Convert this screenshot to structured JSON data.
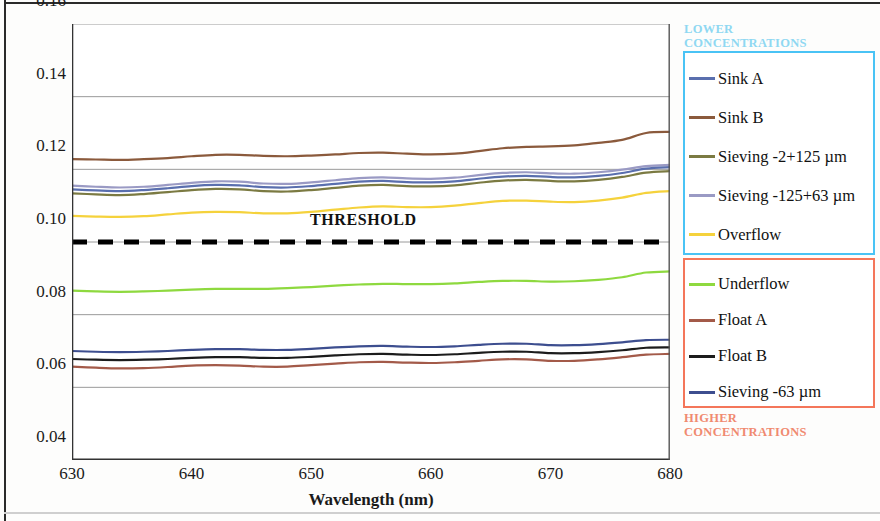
{
  "axes": {
    "ylabel": "Reflectance (%)",
    "xlabel": "Wavelength (nm)",
    "yticks": [
      "0.16",
      "0.14",
      "0.12",
      "0.10",
      "0.08",
      "0.06",
      "0.04"
    ],
    "xticks": [
      "630",
      "640",
      "650",
      "660",
      "670",
      "680"
    ]
  },
  "annotations": {
    "threshold": "THRESHOLD"
  },
  "legend": {
    "lower": {
      "title": "LOWER\nCONCENTRATIONS",
      "title_line1": "LOWER",
      "title_line2": "CONCENTRATIONS",
      "border_color": "#49c3f5",
      "title_color": "#8fd8f2",
      "items": [
        {
          "label": "Sink A",
          "color": "#5a6fae"
        },
        {
          "label": "Sink  B",
          "color": "#8b5a3c"
        },
        {
          "label": "Sieving  -2+125 µm",
          "color": "#7b7a42"
        },
        {
          "label": "Sieving -125+63 µm",
          "color": "#9a9ac4"
        },
        {
          "label": "Overflow",
          "color": "#f5d23c"
        }
      ]
    },
    "higher": {
      "title_line1": "HIGHER",
      "title_line2": "CONCENTRATIONS",
      "border_color": "#f4765a",
      "title_color": "#f08a70",
      "items": [
        {
          "label": "Underflow",
          "color": "#8ed93f"
        },
        {
          "label": "Float A",
          "color": "#a35a49"
        },
        {
          "label": "Float B",
          "color": "#1c1c1c"
        },
        {
          "label": "Sieving  -63 µm",
          "color": "#3d4e8f"
        }
      ]
    }
  },
  "chart_data": {
    "type": "line",
    "title": "",
    "xlabel": "Wavelength (nm)",
    "ylabel": "Reflectance (%)",
    "xlim": [
      630,
      680
    ],
    "ylim": [
      0.04,
      0.16
    ],
    "grid": "horizontal",
    "legend_position": "right",
    "x": [
      630,
      632,
      634,
      636,
      638,
      640,
      642,
      644,
      646,
      648,
      650,
      652,
      654,
      656,
      658,
      660,
      662,
      664,
      666,
      668,
      670,
      672,
      674,
      676,
      678,
      680
    ],
    "series": [
      {
        "name": "Sink B",
        "color": "#8b5a3c",
        "group": "lower",
        "values": [
          0.1228,
          0.1227,
          0.1226,
          0.1228,
          0.1231,
          0.1236,
          0.124,
          0.124,
          0.1237,
          0.1236,
          0.1238,
          0.1241,
          0.1245,
          0.1246,
          0.1243,
          0.1241,
          0.1243,
          0.125,
          0.1258,
          0.1262,
          0.1263,
          0.1266,
          0.1273,
          0.1281,
          0.13,
          0.1303
        ]
      },
      {
        "name": "Sieving -125+63 µm",
        "color": "#9a9ac4",
        "group": "lower",
        "values": [
          0.1155,
          0.1152,
          0.115,
          0.1152,
          0.1157,
          0.1163,
          0.1167,
          0.1166,
          0.1161,
          0.116,
          0.1164,
          0.117,
          0.1176,
          0.1178,
          0.1175,
          0.1174,
          0.1177,
          0.1184,
          0.119,
          0.1192,
          0.1189,
          0.1188,
          0.1192,
          0.1199,
          0.1209,
          0.1212
        ]
      },
      {
        "name": "Sink A",
        "color": "#5a6fae",
        "group": "lower",
        "values": [
          0.1145,
          0.1142,
          0.114,
          0.1143,
          0.1148,
          0.1154,
          0.1157,
          0.1156,
          0.1151,
          0.115,
          0.1154,
          0.116,
          0.1166,
          0.1168,
          0.1165,
          0.1164,
          0.1167,
          0.1174,
          0.118,
          0.1182,
          0.1179,
          0.1178,
          0.1182,
          0.119,
          0.1202,
          0.1206
        ]
      },
      {
        "name": "Sieving -2+125 µm",
        "color": "#7b7a42",
        "group": "lower",
        "values": [
          0.1134,
          0.1131,
          0.1129,
          0.1132,
          0.1137,
          0.1143,
          0.1146,
          0.1145,
          0.114,
          0.1139,
          0.1143,
          0.1149,
          0.1155,
          0.1157,
          0.1154,
          0.1153,
          0.1156,
          0.1163,
          0.1169,
          0.1171,
          0.1168,
          0.1167,
          0.1171,
          0.1179,
          0.1191,
          0.1195
        ]
      },
      {
        "name": "Overflow",
        "color": "#f5d23c",
        "group": "lower",
        "values": [
          0.1072,
          0.107,
          0.1069,
          0.1071,
          0.1076,
          0.1081,
          0.1083,
          0.1082,
          0.1079,
          0.1079,
          0.1083,
          0.1089,
          0.1095,
          0.1098,
          0.1096,
          0.1096,
          0.11,
          0.1107,
          0.1113,
          0.1114,
          0.1111,
          0.111,
          0.1114,
          0.1122,
          0.1135,
          0.114
        ]
      },
      {
        "name": "Underflow",
        "color": "#8ed93f",
        "group": "higher",
        "values": [
          0.0866,
          0.0864,
          0.0863,
          0.0864,
          0.0866,
          0.0869,
          0.0871,
          0.0871,
          0.0871,
          0.0873,
          0.0876,
          0.088,
          0.0883,
          0.0885,
          0.0884,
          0.0884,
          0.0886,
          0.089,
          0.0893,
          0.0893,
          0.0891,
          0.0892,
          0.0896,
          0.0903,
          0.0916,
          0.0919
        ]
      },
      {
        "name": "Sieving -63 µm",
        "color": "#3d4e8f",
        "group": "higher",
        "values": [
          0.07,
          0.0698,
          0.0697,
          0.0698,
          0.07,
          0.0703,
          0.0705,
          0.0705,
          0.0703,
          0.0703,
          0.0706,
          0.071,
          0.0713,
          0.0714,
          0.0712,
          0.0711,
          0.0713,
          0.0717,
          0.072,
          0.072,
          0.0716,
          0.0716,
          0.0719,
          0.0724,
          0.073,
          0.0731
        ]
      },
      {
        "name": "Float B",
        "color": "#1c1c1c",
        "group": "higher",
        "values": [
          0.0678,
          0.0676,
          0.0675,
          0.0676,
          0.0678,
          0.0681,
          0.0683,
          0.0683,
          0.0681,
          0.0681,
          0.0684,
          0.0688,
          0.0691,
          0.0692,
          0.069,
          0.0689,
          0.0691,
          0.0695,
          0.0698,
          0.0698,
          0.0694,
          0.0694,
          0.0697,
          0.0702,
          0.0709,
          0.071
        ]
      },
      {
        "name": "Float A",
        "color": "#a35a49",
        "group": "higher",
        "values": [
          0.0657,
          0.0654,
          0.0652,
          0.0653,
          0.0656,
          0.066,
          0.0661,
          0.066,
          0.0657,
          0.0657,
          0.0661,
          0.0665,
          0.0669,
          0.067,
          0.0668,
          0.0667,
          0.0669,
          0.0673,
          0.0677,
          0.0677,
          0.0673,
          0.0673,
          0.0677,
          0.0683,
          0.069,
          0.0692
        ]
      }
    ],
    "threshold_line": {
      "label": "THRESHOLD",
      "value": 0.1,
      "style": "dashed",
      "color": "#000000"
    }
  }
}
